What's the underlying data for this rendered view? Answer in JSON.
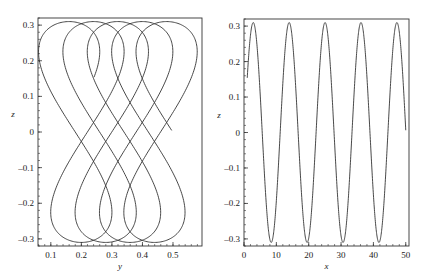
{
  "chart_data": [
    {
      "type": "line",
      "title": "",
      "xlabel": "y",
      "ylabel": "z",
      "xlim": [
        0.058,
        0.595
      ],
      "ylim": [
        -0.32,
        0.32
      ],
      "xticks": [
        0.1,
        0.2,
        0.3,
        0.4,
        0.5
      ],
      "xtick_labels": [
        "0.1",
        "0.2",
        "0.3",
        "0.4",
        "0.5"
      ],
      "yticks": [
        0.3,
        0.2,
        0.1,
        0,
        -0.1,
        -0.2,
        -0.3
      ],
      "ytick_labels": [
        "0.3",
        "0.2",
        "0.1",
        "0",
        "–0.1",
        "–0.2",
        "–0.3"
      ],
      "grid": false,
      "legend": null,
      "description": "Parametric trajectory: z = 0.31·sin(φ), y = 0.14 + 0.0127·φ + 0.11·sin(2φ), φ from 0.52 to 9π; drifting figure-eight loops",
      "curve": {
        "amp_z": 0.31,
        "y0": 0.14,
        "drift": 0.0127,
        "amp_y": 0.11,
        "phi_start": 0.52,
        "phi_end": 28.27
      },
      "key_points": {
        "start": [
          0.25,
          0.16
        ],
        "end": [
          0.5,
          0.0
        ],
        "top_apexes_y": [
          0.166,
          0.244,
          0.326,
          0.402
        ],
        "bottom_apexes_y": [
          0.205,
          0.285,
          0.365,
          0.445
        ]
      }
    },
    {
      "type": "line",
      "title": "",
      "xlabel": "x",
      "ylabel": "z",
      "xlim": [
        0,
        51
      ],
      "ylim": [
        -0.32,
        0.32
      ],
      "xticks": [
        0,
        10,
        20,
        30,
        40,
        50
      ],
      "xtick_labels": [
        "0",
        "10",
        "20",
        "30",
        "40",
        "50"
      ],
      "yticks": [
        0.3,
        0.2,
        0.1,
        0,
        -0.1,
        -0.2,
        -0.3
      ],
      "ytick_labels": [
        "0.3",
        "0.2",
        "0.1",
        "0",
        "–0.1",
        "–0.2",
        "–0.3"
      ],
      "grid": false,
      "legend": null,
      "description": "z oscillating between ±0.31 with period ≈ 11.1, from x=1 (z≈0.155) to x=50 (z≈0)",
      "curve": {
        "amp": 0.31,
        "omega": 0.566,
        "phase": 0.52,
        "x_start": 1,
        "x_end": 50
      },
      "key_points": {
        "peaks_x": [
          2.5,
          13.6,
          24.7,
          35.8,
          46.9
        ],
        "troughs_x": [
          8.0,
          19.1,
          30.2,
          41.3
        ],
        "start": [
          1,
          0.155
        ],
        "end": [
          50,
          0.0
        ]
      }
    }
  ]
}
